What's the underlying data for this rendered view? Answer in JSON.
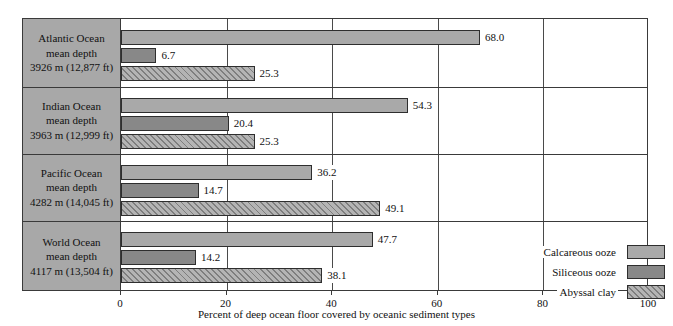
{
  "top_cut_text": "",
  "chart_data": {
    "type": "bar",
    "orientation": "horizontal",
    "title": "",
    "xlabel": "Percent of deep ocean floor covered by oceanic sediment types",
    "ylabel": "",
    "xlim": [
      0,
      100
    ],
    "xticks": [
      0,
      20,
      40,
      60,
      80,
      100
    ],
    "xtick_labels": [
      "0",
      "20",
      "40",
      "60",
      "80",
      "100"
    ],
    "grid": true,
    "legend_position": "inside bottom-right",
    "categories": [
      "Atlantic Ocean mean depth 3926 m (12,877 ft)",
      "Indian Ocean mean depth 3963 m (12,999 ft)",
      "Pacific Ocean mean depth 4282 m (14,045 ft)",
      "World Ocean mean depth 4117 m (13,504 ft)"
    ],
    "series": [
      {
        "name": "Calcareous ooze",
        "color": "#a9a9a9",
        "values": [
          68.0,
          54.3,
          36.2,
          47.7
        ]
      },
      {
        "name": "Siliceous ooze",
        "color": "#888888",
        "values": [
          6.7,
          20.4,
          14.7,
          14.2
        ]
      },
      {
        "name": "Abyssal clay",
        "color": "#b4b4b4",
        "values": [
          25.3,
          25.3,
          49.1,
          38.1
        ]
      }
    ]
  },
  "groups": [
    {
      "name": "atlantic-ocean",
      "line1": "Atlantic Ocean",
      "line2": "mean depth",
      "line3": "3926 m (12,877 ft)",
      "bars": [
        {
          "series": "Calcareous ooze",
          "value": 68.0,
          "label": "68.0"
        },
        {
          "series": "Siliceous ooze",
          "value": 6.7,
          "label": "6.7"
        },
        {
          "series": "Abyssal clay",
          "value": 25.3,
          "label": "25.3"
        }
      ]
    },
    {
      "name": "indian-ocean",
      "line1": "Indian Ocean",
      "line2": "mean depth",
      "line3": "3963 m (12,999 ft)",
      "bars": [
        {
          "series": "Calcareous ooze",
          "value": 54.3,
          "label": "54.3"
        },
        {
          "series": "Siliceous ooze",
          "value": 20.4,
          "label": "20.4"
        },
        {
          "series": "Abyssal clay",
          "value": 25.3,
          "label": "25.3"
        }
      ]
    },
    {
      "name": "pacific-ocean",
      "line1": "Pacific Ocean",
      "line2": "mean depth",
      "line3": "4282 m (14,045 ft)",
      "bars": [
        {
          "series": "Calcareous ooze",
          "value": 36.2,
          "label": "36.2"
        },
        {
          "series": "Siliceous ooze",
          "value": 14.7,
          "label": "14.7"
        },
        {
          "series": "Abyssal clay",
          "value": 49.1,
          "label": "49.1"
        }
      ]
    },
    {
      "name": "world-ocean",
      "line1": "World Ocean",
      "line2": "mean depth",
      "line3": "4117 m (13,504 ft)",
      "bars": [
        {
          "series": "Calcareous ooze",
          "value": 47.7,
          "label": "47.7"
        },
        {
          "series": "Siliceous ooze",
          "value": 14.2,
          "label": "14.2"
        },
        {
          "series": "Abyssal clay",
          "value": 38.1,
          "label": "38.1"
        }
      ]
    }
  ],
  "legend": {
    "items": [
      {
        "label": "Calcareous ooze",
        "swatch": "calcareous"
      },
      {
        "label": "Siliceous ooze",
        "swatch": "siliceous"
      },
      {
        "label": "Abyssal clay",
        "swatch": "abyssal"
      }
    ]
  },
  "axis": {
    "title": "Percent of deep ocean floor covered by oceanic sediment types",
    "ticks": [
      "0",
      "20",
      "40",
      "60",
      "80",
      "100"
    ]
  }
}
